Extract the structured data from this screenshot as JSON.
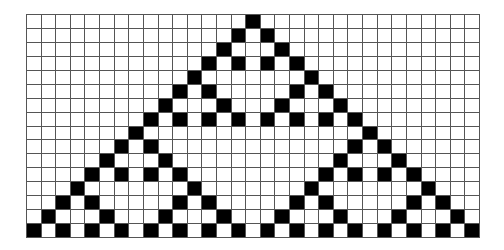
{
  "diagram": {
    "type": "cellular-automaton",
    "rule": 90,
    "columns": 31,
    "rows": 16,
    "colors": {
      "on": "#000000",
      "off": "#ffffff",
      "grid": "#555555"
    },
    "cells": [
      "...............#...............",
      "..............#.#..............",
      ".............#...#.............",
      "............#.#.#.#............",
      "...........#.......#...........",
      "..........#.#.....#.#..........",
      ".........#...#...#...#.........",
      "........#.#.#.#.#.#.#.#........",
      ".......#...............#.......",
      "......#.#.............#.#......",
      ".....#...#...........#...#.....",
      "....#.#.#.#.........#.#.#.#....",
      "...#.......#.......#.......#...",
      "..#.#.....#.#.....#.#.....#.#..",
      ".#...#...#...#...#...#...#...#.",
      "#.#.#.#.#.#.#.#.#.#.#.#.#.#.#.#"
    ]
  }
}
